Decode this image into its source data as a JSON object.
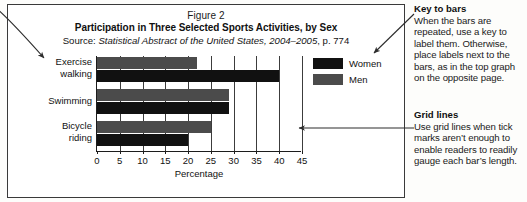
{
  "figure": {
    "figure_label": "Figure 2",
    "title": "Participation in Three Selected Sports Activities, by Sex",
    "source_lead": "Source: ",
    "source_italic": "Statistical Abstract of the United States, 2004–2005",
    "source_tail": ", p. 774"
  },
  "chart_data": {
    "type": "bar",
    "orientation": "horizontal",
    "title": "Participation in Three Selected Sports Activities, by Sex",
    "subtitle": "Figure 2",
    "source": "Source: Statistical Abstract of the United States, 2004–2005, p. 774",
    "categories": [
      "Exercise walking",
      "Swimming",
      "Bicycle riding"
    ],
    "category_lines": [
      [
        "Exercise",
        "walking"
      ],
      [
        "Swimming"
      ],
      [
        "Bicycle",
        "riding"
      ]
    ],
    "series": [
      {
        "name": "Women",
        "color": "#111111",
        "values": [
          40,
          29,
          20
        ]
      },
      {
        "name": "Men",
        "color": "#4b4b4b",
        "values": [
          22,
          29,
          25
        ]
      }
    ],
    "series_draw_order": [
      "Men",
      "Women"
    ],
    "xlabel": "Percentage",
    "ylabel": "",
    "xlim": [
      0,
      45
    ],
    "xticks": [
      0,
      5,
      10,
      15,
      20,
      25,
      30,
      35,
      40,
      45
    ],
    "xtick_labels": [
      "0",
      "5",
      "10",
      "15",
      "20",
      "25",
      "30",
      "35",
      "40",
      "45"
    ],
    "grid": true,
    "grid_axis": "x",
    "legend": [
      "Women",
      "Men"
    ],
    "legend_position": "right"
  },
  "legend": {
    "items": [
      {
        "label": "Women",
        "color": "#111111"
      },
      {
        "label": "Men",
        "color": "#4b4b4b"
      }
    ]
  },
  "notes": {
    "key_to_bars": {
      "heading": "Key to bars",
      "body": "When the bars are repeated, use a key to label them. Otherwise, place labels next to the bars, as in the top graph on the opposite page."
    },
    "grid_lines": {
      "heading": "Grid lines",
      "body": "Use grid lines when tick marks aren’t enough to enable readers to readily gauge each bar’s length."
    }
  },
  "annotations": {
    "arrow_to_labels": "arrow pointing to category labels",
    "arrow_to_legend": "arrow pointing to legend key",
    "arrow_to_gridlines": "arrow pointing to grid lines"
  }
}
